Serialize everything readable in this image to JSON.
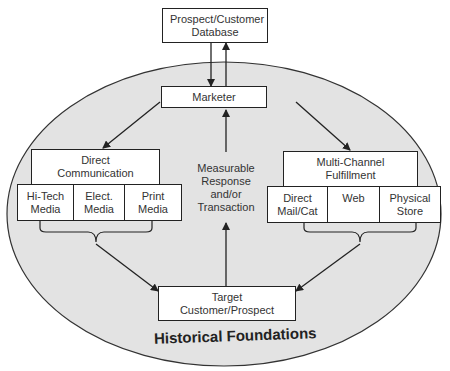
{
  "diagram": {
    "colors": {
      "ellipse_fill": "#e3e3e3",
      "stroke": "#222222",
      "box_fill": "#ffffff"
    },
    "database": {
      "label": "Prospect/Customer Database"
    },
    "marketer": {
      "label": "Marketer"
    },
    "direct_communication": {
      "label": "Direct Communication",
      "items": [
        {
          "label": "Hi-Tech Media"
        },
        {
          "label": "Elect. Media"
        },
        {
          "label": "Print Media"
        }
      ]
    },
    "center_label": "Measurable Response and/or Transaction",
    "multi_channel": {
      "label": "Multi-Channel Fulfillment",
      "items": [
        {
          "label": "Direct Mail/Cat"
        },
        {
          "label": "Web"
        },
        {
          "label": "Physical Store"
        }
      ]
    },
    "target": {
      "label": "Target Customer/Prospect"
    },
    "foundation_label": "Historical Foundations"
  }
}
